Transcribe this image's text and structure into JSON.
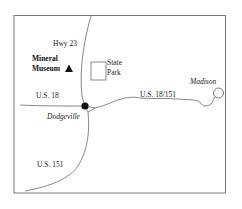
{
  "map": {
    "frame": {
      "x": 14,
      "y": 15,
      "width": 212,
      "height": 178,
      "stroke": "#7a7a7a"
    },
    "roads": [
      {
        "name": "Hwy 23",
        "label": "Hwy 23",
        "label_pos": [
          53,
          46
        ]
      },
      {
        "name": "U.S. 18",
        "label": "U.S. 18",
        "label_pos": [
          36,
          98
        ]
      },
      {
        "name": "U.S. 18/151",
        "label": "U.S. 18/151",
        "label_pos": [
          140,
          97
        ]
      },
      {
        "name": "U.S. 151",
        "label": "U.S. 151",
        "label_pos": [
          37,
          168
        ]
      }
    ],
    "places": {
      "mineral_museum": {
        "line1": "Mineral",
        "line2": "Museum",
        "symbol": "triangle-icon"
      },
      "state_park": {
        "line1": "State",
        "line2": "Park",
        "symbol": "rectangle-icon"
      },
      "dodgeville": {
        "label": "Dodgeville",
        "symbol": "filled-circle-icon"
      },
      "madison": {
        "label": "Madison",
        "symbol": "open-circle-icon"
      }
    },
    "colors": {
      "road": "#6a6a6a",
      "frame": "#7a7a7a",
      "text": "#1a1a1a",
      "symbol": "#111111"
    }
  }
}
